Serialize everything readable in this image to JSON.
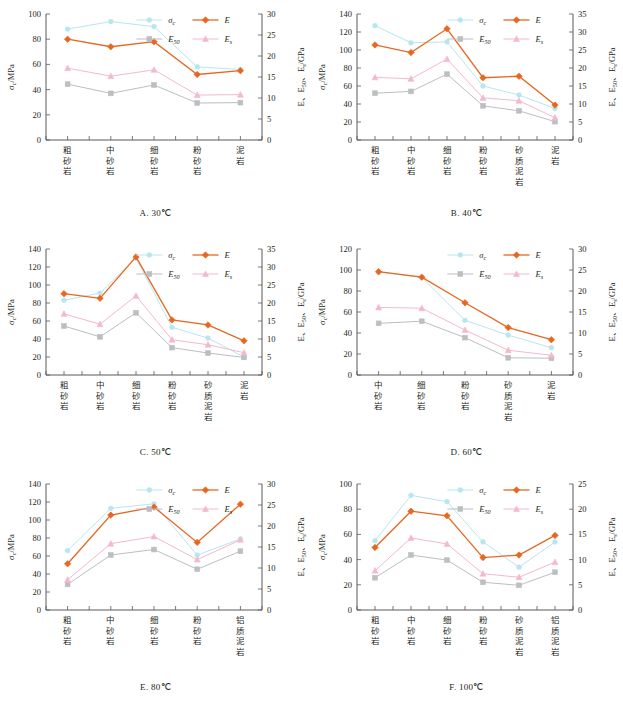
{
  "figure": {
    "axis_left_label": "σ_c /MPa",
    "axis_right_label": "E、E_50、E_s /GPa",
    "legend": [
      {
        "key": "sigma_c",
        "label": "σ_c",
        "color": "#b8e6ef",
        "marker": "circle"
      },
      {
        "key": "E",
        "label": "E",
        "color": "#e8661f",
        "marker": "diamond"
      },
      {
        "key": "E50",
        "label": "E_50",
        "color": "#bcbec0",
        "marker": "square"
      },
      {
        "key": "Es",
        "label": "E_s",
        "color": "#f4b9cc",
        "marker": "triangle"
      }
    ]
  },
  "chart_data": [
    {
      "id": "A",
      "type": "line",
      "title": "A. 30℃",
      "xlabel": "",
      "ylabel": "σ_c /MPa",
      "y2label": "E、E_50、E_s /GPa",
      "categories": [
        "粗砂岩",
        "中砂岩",
        "细砂岩",
        "粉砂岩",
        "泥岩"
      ],
      "ylim": [
        0,
        100
      ],
      "yticks": [
        0,
        20,
        40,
        60,
        80,
        100
      ],
      "y2lim": [
        0,
        30
      ],
      "y2ticks": [
        0,
        5,
        10,
        15,
        20,
        25,
        30
      ],
      "grid": false,
      "legend_position": "top-right",
      "series": [
        {
          "name": "σ_c",
          "axis": "left",
          "values": [
            88,
            94,
            90,
            58,
            56
          ]
        },
        {
          "name": "E",
          "axis": "right",
          "values": [
            24.0,
            22.2,
            23.4,
            15.6,
            16.5
          ]
        },
        {
          "name": "E_50",
          "axis": "right",
          "values": [
            13.3,
            11.1,
            13.1,
            8.8,
            8.9
          ]
        },
        {
          "name": "E_s",
          "axis": "right",
          "values": [
            17.1,
            15.2,
            16.7,
            10.7,
            10.8
          ]
        }
      ]
    },
    {
      "id": "B",
      "type": "line",
      "title": "B. 40℃",
      "xlabel": "",
      "ylabel": "σ_c /MPa",
      "y2label": "E、E_50、E_s /GPa",
      "categories": [
        "粗砂岩",
        "中砂岩",
        "细砂岩",
        "粉砂岩",
        "砂质泥岩",
        "泥岩"
      ],
      "ylim": [
        0,
        140
      ],
      "yticks": [
        0,
        20,
        40,
        60,
        80,
        100,
        120,
        140
      ],
      "y2lim": [
        0,
        35
      ],
      "y2ticks": [
        0,
        5,
        10,
        15,
        20,
        25,
        30,
        35
      ],
      "grid": false,
      "legend_position": "top-right",
      "series": [
        {
          "name": "σ_c",
          "axis": "left",
          "values": [
            127,
            108,
            109,
            60,
            50,
            35
          ]
        },
        {
          "name": "E",
          "axis": "right",
          "values": [
            26.4,
            24.3,
            30.9,
            17.3,
            17.7,
            9.7
          ]
        },
        {
          "name": "E_50",
          "axis": "right",
          "values": [
            13.0,
            13.5,
            18.3,
            9.5,
            8.1,
            5.1
          ]
        },
        {
          "name": "E_s",
          "axis": "right",
          "values": [
            17.4,
            17.0,
            22.5,
            11.7,
            10.9,
            6.2
          ]
        }
      ]
    },
    {
      "id": "C",
      "type": "line",
      "title": "C. 50℃",
      "xlabel": "",
      "ylabel": "σ_c /MPa",
      "y2label": "E、E_50、E_s /GPa",
      "categories": [
        "粗砂岩",
        "中砂岩",
        "细砂岩",
        "粉砂岩",
        "砂质泥岩",
        "泥岩"
      ],
      "ylim": [
        0,
        140
      ],
      "yticks": [
        0,
        20,
        40,
        60,
        80,
        100,
        120,
        140
      ],
      "y2lim": [
        0,
        35
      ],
      "y2ticks": [
        0,
        5,
        10,
        15,
        20,
        25,
        30,
        35
      ],
      "grid": false,
      "legend_position": "top-right",
      "series": [
        {
          "name": "σ_c",
          "axis": "left",
          "values": [
            83,
            91,
            130,
            53,
            41,
            20
          ]
        },
        {
          "name": "E",
          "axis": "right",
          "values": [
            22.6,
            21.3,
            32.8,
            15.3,
            13.9,
            9.5
          ]
        },
        {
          "name": "E_50",
          "axis": "right",
          "values": [
            13.6,
            10.6,
            17.3,
            7.6,
            6.1,
            4.9
          ]
        },
        {
          "name": "E_s",
          "axis": "right",
          "values": [
            17.0,
            14.1,
            22.0,
            9.8,
            8.4,
            6.2
          ]
        }
      ]
    },
    {
      "id": "D",
      "type": "line",
      "title": "D. 60℃",
      "xlabel": "",
      "ylabel": "σ_c /MPa",
      "y2label": "E、E_50、E_s /GPa",
      "categories": [
        "中砂岩",
        "细砂岩",
        "粉砂岩",
        "砂质泥岩",
        "泥岩"
      ],
      "ylim": [
        0,
        120
      ],
      "yticks": [
        0,
        20,
        40,
        60,
        80,
        100,
        120
      ],
      "y2lim": [
        0,
        30
      ],
      "y2ticks": [
        0,
        5,
        10,
        15,
        20,
        25,
        30
      ],
      "grid": false,
      "legend_position": "top-right",
      "series": [
        {
          "name": "σ_c",
          "axis": "left",
          "values": [
            98,
            93,
            52,
            38,
            26
          ]
        },
        {
          "name": "E",
          "axis": "right",
          "values": [
            24.6,
            23.3,
            17.2,
            11.3,
            8.4
          ]
        },
        {
          "name": "E_50",
          "axis": "right",
          "values": [
            12.3,
            12.8,
            8.9,
            4.1,
            4.0
          ]
        },
        {
          "name": "E_s",
          "axis": "right",
          "values": [
            16.1,
            15.9,
            10.7,
            5.9,
            4.7
          ]
        }
      ]
    },
    {
      "id": "E",
      "type": "line",
      "title": "E. 80℃",
      "xlabel": "",
      "ylabel": "σ_c /MPa",
      "y2label": "E、E_50、E_s /GPa",
      "categories": [
        "粗砂岩",
        "中砂岩",
        "细砂岩",
        "粉砂岩",
        "铝质泥岩"
      ],
      "ylim": [
        0,
        140
      ],
      "yticks": [
        0,
        20,
        40,
        60,
        80,
        100,
        120,
        140
      ],
      "y2lim": [
        0,
        30
      ],
      "y2ticks": [
        0,
        5,
        10,
        15,
        20,
        25,
        30
      ],
      "grid": false,
      "legend_position": "top-right",
      "series": [
        {
          "name": "σ_c",
          "axis": "left",
          "values": [
            66,
            113,
            118,
            61,
            79
          ]
        },
        {
          "name": "E",
          "axis": "right",
          "values": [
            11.0,
            22.6,
            24.5,
            16.1,
            25.2
          ]
        },
        {
          "name": "E_50",
          "axis": "right",
          "values": [
            6.1,
            13.1,
            14.4,
            9.7,
            14.0
          ]
        },
        {
          "name": "E_s",
          "axis": "right",
          "values": [
            7.2,
            15.8,
            17.5,
            12.0,
            16.7
          ]
        }
      ]
    },
    {
      "id": "F",
      "type": "line",
      "title": "F. 100℃",
      "xlabel": "",
      "ylabel": "σ_c /MPa",
      "y2label": "E、E_50、E_s /GPa",
      "categories": [
        "粗砂岩",
        "中砂岩",
        "细砂岩",
        "粉砂岩",
        "砂质泥岩",
        "铝质泥岩"
      ],
      "ylim": [
        0,
        100
      ],
      "yticks": [
        0,
        20,
        40,
        60,
        80,
        100
      ],
      "y2lim": [
        0,
        25
      ],
      "y2ticks": [
        0,
        5,
        10,
        15,
        20,
        25
      ],
      "grid": false,
      "legend_position": "top-right",
      "series": [
        {
          "name": "σ_c",
          "axis": "left",
          "values": [
            55,
            91,
            86,
            54,
            34,
            54
          ]
        },
        {
          "name": "E",
          "axis": "right",
          "values": [
            12.4,
            19.6,
            18.7,
            10.4,
            10.9,
            14.8
          ]
        },
        {
          "name": "E_50",
          "axis": "right",
          "values": [
            6.4,
            10.9,
            9.9,
            5.5,
            4.9,
            7.5
          ]
        },
        {
          "name": "E_s",
          "axis": "right",
          "values": [
            7.8,
            14.3,
            13.1,
            7.2,
            6.5,
            9.5
          ]
        }
      ]
    }
  ]
}
